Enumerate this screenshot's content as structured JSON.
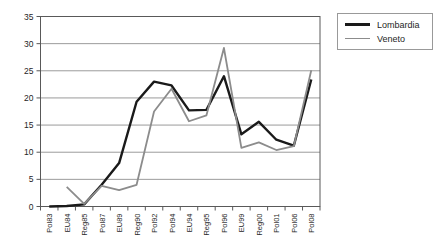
{
  "chart_data": {
    "type": "line",
    "title": "",
    "xlabel": "",
    "ylabel": "",
    "categories": [
      "Pol83",
      "EU84",
      "Reg85",
      "Pol87",
      "EU89",
      "Reg90",
      "Pol92",
      "Pol94",
      "EU94",
      "Reg95",
      "Pol96",
      "EU99",
      "Reg00",
      "Pol01",
      "Pol06",
      "Pol08"
    ],
    "series": [
      {
        "name": "Lombardia",
        "color": "#1a1a1a",
        "thickness": 2.4,
        "values": [
          0,
          0.1,
          0.4,
          4,
          8,
          19.3,
          23,
          22.3,
          17.7,
          17.8,
          24,
          13.3,
          15.6,
          12.3,
          11.2,
          23.4
        ]
      },
      {
        "name": "Veneto",
        "color": "#8c8c8c",
        "thickness": 1.8,
        "values": [
          null,
          3.6,
          0.5,
          3.8,
          3,
          4,
          17.5,
          21.7,
          15.7,
          16.8,
          29.2,
          10.8,
          11.8,
          10.4,
          11.1,
          25.1
        ]
      }
    ],
    "ylim": [
      0,
      35
    ],
    "yticks": [
      0,
      5,
      10,
      15,
      20,
      25,
      30,
      35
    ],
    "grid": true,
    "legend_position": "outside-right",
    "colors": {
      "background": "#ffffff",
      "plot_border": "#595959",
      "gridline": "#9b9b9b",
      "tick": "#595959",
      "label_text": "#262626",
      "legend_border": "#999999"
    }
  }
}
